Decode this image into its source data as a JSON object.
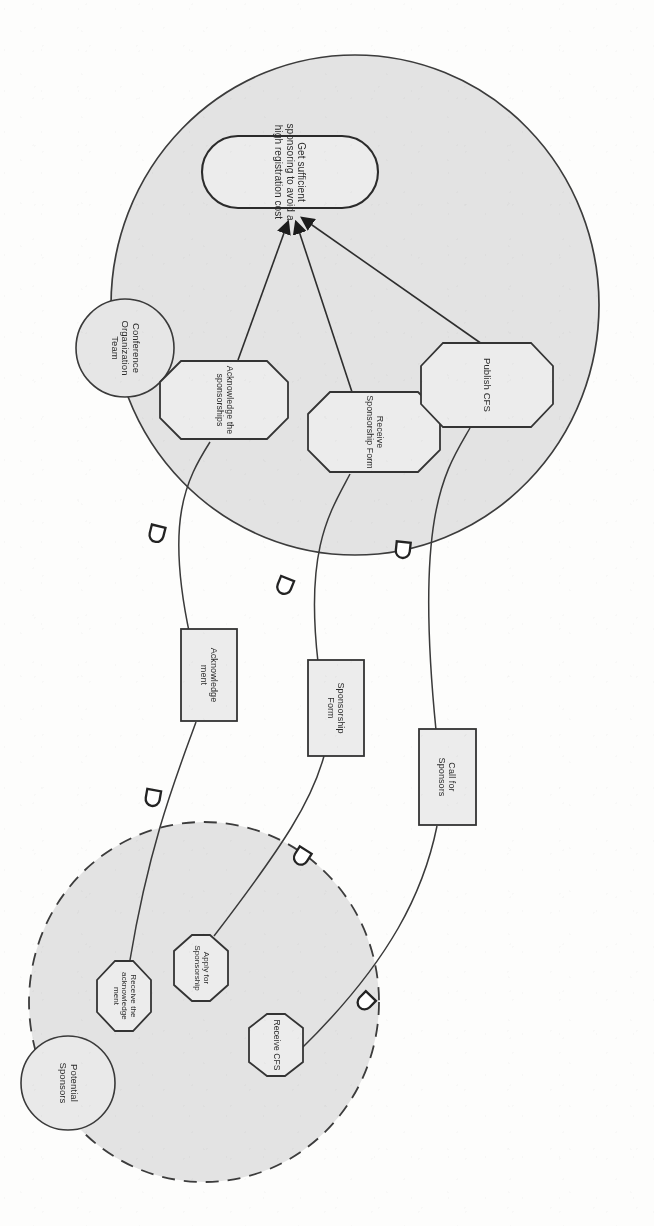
{
  "diagram": {
    "notation": "i* / Tropos actor diagram",
    "rotation_degrees": 90,
    "colors": {
      "actor_boundary_fill": "#e2e2e2",
      "actor_boundary_stroke": "#3c3c3c",
      "node_fill": "#eeeeee",
      "node_stroke": "#3a3a3a",
      "text": "#2b2b2b",
      "arrowhead": "#1c1c1c",
      "paper": "#fdfdfc"
    }
  },
  "actors": [
    {
      "id": "conference-organization-team",
      "label": "Conference\nOrganization\nTeam",
      "boundary_style": "solid",
      "boundary_cx": 355,
      "boundary_cy": 305,
      "boundary_rx": 244,
      "boundary_ry": 250,
      "role_cx": 125,
      "role_cy": 348,
      "role_r": 49
    },
    {
      "id": "potential-sponsors",
      "label": "Potential\nSponsors",
      "boundary_style": "dashed",
      "boundary_cx": 204,
      "boundary_cy": 1002,
      "boundary_rx": 175,
      "boundary_ry": 180,
      "role_cx": 68,
      "role_cy": 1083,
      "role_r": 47
    }
  ],
  "goals": [
    {
      "id": "get-sufficient-sponsoring",
      "label": "Get sufficient\nsponsoring to avoid a\nhigh registration cost",
      "shape": "rounded-rectangle",
      "actor": "conference-organization-team",
      "cx": 290,
      "cy": 172,
      "w": 176,
      "h": 72
    }
  ],
  "tasks": [
    {
      "id": "acknowledge-the-sponsorships",
      "label": "Acknowledge the\nsponsorships",
      "shape": "hexagon",
      "actor": "conference-organization-team",
      "cx": 224,
      "cy": 400,
      "w": 128,
      "h": 78
    },
    {
      "id": "receive-sponsorship-form",
      "label": "Receive\nSponsorship Form",
      "shape": "hexagon",
      "actor": "conference-organization-team",
      "cx": 374,
      "cy": 432,
      "w": 132,
      "h": 80
    },
    {
      "id": "publish-cfs",
      "label": "Publish CFS",
      "shape": "hexagon",
      "actor": "conference-organization-team",
      "cx": 487,
      "cy": 385,
      "w": 132,
      "h": 84
    },
    {
      "id": "receive-the-acknowledgement",
      "label": "Receive the\nacknowledge\nment",
      "shape": "hexagon",
      "actor": "potential-sponsors",
      "cx": 124,
      "cy": 996,
      "w": 108,
      "h": 70
    },
    {
      "id": "apply-for-sponsorship",
      "label": "Apply for\nSponsorship",
      "shape": "hexagon",
      "actor": "potential-sponsors",
      "cx": 201,
      "cy": 968,
      "w": 110,
      "h": 66
    },
    {
      "id": "receive-cfs",
      "label": "Receive CFS",
      "shape": "hexagon",
      "actor": "potential-sponsors",
      "cx": 276,
      "cy": 1045,
      "w": 110,
      "h": 62
    }
  ],
  "resources": [
    {
      "id": "acknowledgement",
      "label": "Acknowledge\nment",
      "shape": "rectangle",
      "cx": 209,
      "cy": 675,
      "w": 56,
      "h": 92
    },
    {
      "id": "sponsorship-form",
      "label": "Sponsorship\nForm",
      "shape": "rectangle",
      "cx": 336,
      "cy": 708,
      "w": 56,
      "h": 96
    },
    {
      "id": "call-for-sponsors",
      "label": "Call for\nSponsors",
      "shape": "rectangle",
      "cx": 447,
      "cy": 777,
      "w": 57,
      "h": 96
    }
  ],
  "contribution_links": [
    {
      "id": "link-acknowledge-to-goal",
      "from": "acknowledge-the-sponsorships",
      "to": "get-sufficient-sponsoring",
      "arrowhead": "filled-triangle"
    },
    {
      "id": "link-receive-form-to-goal",
      "from": "receive-sponsorship-form",
      "to": "get-sufficient-sponsoring",
      "arrowhead": "filled-triangle"
    },
    {
      "id": "link-publish-cfs-to-goal",
      "from": "publish-cfs",
      "to": "get-sufficient-sponsoring",
      "arrowhead": "filled-triangle"
    }
  ],
  "dependency_links": [
    {
      "id": "dep-acknowledgement",
      "resource": "acknowledgement",
      "depender": "receive-the-acknowledgement",
      "dependee": "acknowledge-the-sponsorships",
      "marker": "dependency-d"
    },
    {
      "id": "dep-sponsorship-form",
      "resource": "sponsorship-form",
      "depender": "receive-sponsorship-form",
      "dependee": "apply-for-sponsorship",
      "marker": "dependency-d"
    },
    {
      "id": "dep-call-for-sponsors",
      "resource": "call-for-sponsors",
      "depender": "receive-cfs",
      "dependee": "publish-cfs",
      "marker": "dependency-d"
    }
  ],
  "dependency_markers": [
    {
      "id": "marker-ack-upper",
      "cx": 157,
      "cy": 533,
      "rot": 104
    },
    {
      "id": "marker-ack-lower",
      "cx": 153,
      "cy": 797,
      "rot": 100
    },
    {
      "id": "marker-form-upper",
      "cx": 285,
      "cy": 585,
      "rot": 112
    },
    {
      "id": "marker-form-lower",
      "cx": 302,
      "cy": 856,
      "rot": 122
    },
    {
      "id": "marker-cfs-upper",
      "cx": 403,
      "cy": 549,
      "rot": 96
    },
    {
      "id": "marker-cfs-lower",
      "cx": 366,
      "cy": 1001,
      "rot": 134
    }
  ]
}
